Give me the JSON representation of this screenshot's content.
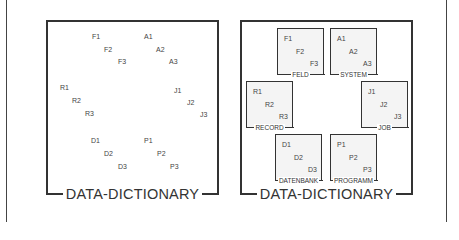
{
  "left_panel": {
    "title": "DATA-DICTIONARY",
    "labels": [
      {
        "text": "F1",
        "x": 44,
        "y": 11
      },
      {
        "text": "F2",
        "x": 56,
        "y": 24
      },
      {
        "text": "F3",
        "x": 70,
        "y": 36
      },
      {
        "text": "A1",
        "x": 96,
        "y": 11
      },
      {
        "text": "A2",
        "x": 108,
        "y": 24
      },
      {
        "text": "A3",
        "x": 121,
        "y": 36
      },
      {
        "text": "R1",
        "x": 12,
        "y": 62
      },
      {
        "text": "R2",
        "x": 24,
        "y": 75
      },
      {
        "text": "R3",
        "x": 37,
        "y": 88
      },
      {
        "text": "J1",
        "x": 126,
        "y": 65
      },
      {
        "text": "J2",
        "x": 139,
        "y": 77
      },
      {
        "text": "J3",
        "x": 152,
        "y": 89
      },
      {
        "text": "D1",
        "x": 43,
        "y": 115
      },
      {
        "text": "D2",
        "x": 56,
        "y": 128
      },
      {
        "text": "D3",
        "x": 70,
        "y": 141
      },
      {
        "text": "P1",
        "x": 96,
        "y": 115
      },
      {
        "text": "P2",
        "x": 109,
        "y": 128
      },
      {
        "text": "P3",
        "x": 122,
        "y": 141
      }
    ]
  },
  "right_panel": {
    "title": "DATA-DICTIONARY",
    "boxes": [
      {
        "name": "FELD",
        "x": 35,
        "y": 6,
        "items": [
          "F1",
          "F2",
          "F3"
        ]
      },
      {
        "name": "SYSTEM",
        "x": 88,
        "y": 6,
        "items": [
          "A1",
          "A2",
          "A3"
        ]
      },
      {
        "name": "RECORD",
        "x": 4,
        "y": 59,
        "items": [
          "R1",
          "R2",
          "R3"
        ]
      },
      {
        "name": "JOB",
        "x": 119,
        "y": 59,
        "items": [
          "J1",
          "J2",
          "J3"
        ]
      },
      {
        "name": "DATENBANK",
        "x": 33,
        "y": 112,
        "items": [
          "D1",
          "D2",
          "D3"
        ]
      },
      {
        "name": "PROGRAMM",
        "x": 88,
        "y": 112,
        "items": [
          "P1",
          "P2",
          "P3"
        ]
      }
    ]
  },
  "colors": {
    "line": "#333333",
    "box_fill": "#f4f4f4",
    "background": "#ffffff"
  }
}
